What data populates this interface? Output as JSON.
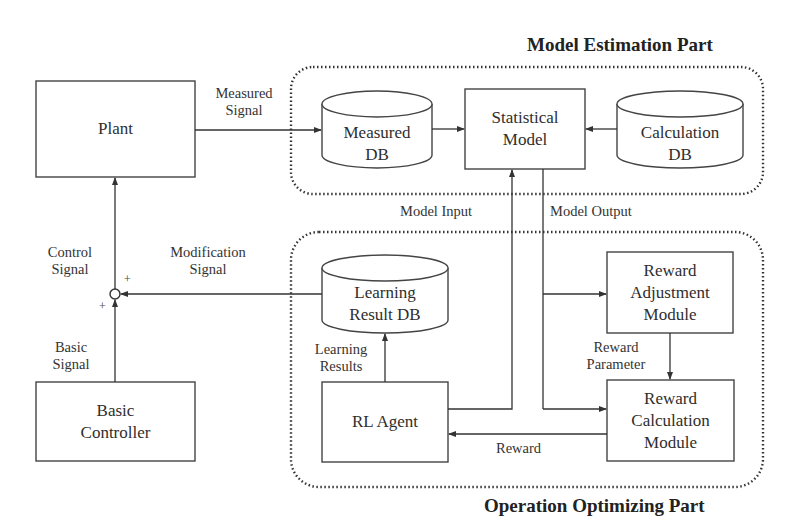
{
  "groups": {
    "model_estimation": {
      "title": "Model Estimation Part"
    },
    "operation_optimizing": {
      "title": "Operation Optimizing Part"
    }
  },
  "nodes": {
    "plant": {
      "label": "Plant",
      "shape": "box"
    },
    "basic_controller": {
      "label": "Basic\nController",
      "shape": "box"
    },
    "measured_db": {
      "label": "Measured\nDB",
      "shape": "cylinder"
    },
    "statistical_model": {
      "label": "Statistical\nModel",
      "shape": "box"
    },
    "calculation_db": {
      "label": "Calculation\nDB",
      "shape": "cylinder"
    },
    "learning_result_db": {
      "label": "Learning\nResult DB",
      "shape": "cylinder"
    },
    "rl_agent": {
      "label": "RL Agent",
      "shape": "box"
    },
    "reward_adjustment_module": {
      "label": "Reward\nAdjustment\nModule",
      "shape": "box"
    },
    "reward_calculation_module": {
      "label": "Reward\nCalculation\nModule",
      "shape": "box"
    },
    "summing_junction": {
      "shape": "circle",
      "plus_top": "+",
      "plus_bottom": "+"
    }
  },
  "edges": {
    "measured_signal": {
      "label": "Measured\nSignal",
      "from": "Plant",
      "to": "Measured DB"
    },
    "measured_to_model": {
      "from": "Measured DB",
      "to": "Statistical Model"
    },
    "calc_to_model": {
      "from": "Calculation DB",
      "to": "Statistical Model"
    },
    "model_input": {
      "label": "Model Input",
      "from": "RL Agent",
      "to": "Statistical Model"
    },
    "model_output": {
      "label": "Model Output",
      "from": "Statistical Model",
      "to": "Reward Adjustment Module / Reward Calculation Module"
    },
    "control_signal": {
      "label": "Control\nSignal",
      "from": "Summing Junction",
      "to": "Plant"
    },
    "modification_signal": {
      "label": "Modification\nSignal",
      "from": "Learning Result DB",
      "to": "Summing Junction"
    },
    "basic_signal": {
      "label": "Basic\nSignal",
      "from": "Basic Controller",
      "to": "Summing Junction"
    },
    "learning_results": {
      "label": "Learning\nResults",
      "from": "RL Agent",
      "to": "Learning Result DB"
    },
    "reward_parameter": {
      "label": "Reward\nParameter",
      "from": "Reward Adjustment Module",
      "to": "Reward Calculation Module"
    },
    "reward": {
      "label": "Reward",
      "from": "Reward Calculation Module",
      "to": "RL Agent"
    }
  },
  "colors": {
    "line": "#333333",
    "background": "#ffffff"
  }
}
